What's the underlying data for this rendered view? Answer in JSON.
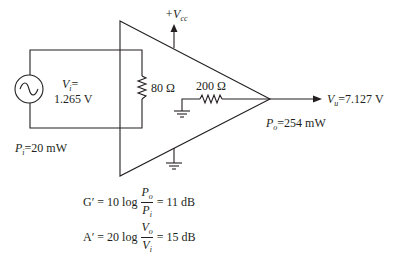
{
  "circuit": {
    "supply_label": "+V",
    "supply_sub": "cc",
    "input_voltage": {
      "symbol": "V",
      "sub": "i",
      "eq": "=",
      "value": "1.265 V"
    },
    "input_resistor": "80 Ω",
    "output_resistor": "200 Ω",
    "output_voltage": {
      "symbol": "V",
      "sub": "u",
      "value": "=7.127 V"
    },
    "output_power": {
      "symbol": "P",
      "sub": "o",
      "value": "=254 mW"
    },
    "input_power": {
      "symbol": "P",
      "sub": "i",
      "value": "=20 mW"
    }
  },
  "equations": {
    "power_gain": {
      "lhs": "G′ = 10 log",
      "num": "P",
      "num_sub": "o",
      "den": "P",
      "den_sub": "i",
      "rhs": "= 11 dB"
    },
    "voltage_gain": {
      "lhs": "A′ = 20 log",
      "num": "V",
      "num_sub": "o",
      "den": "V",
      "den_sub": "i",
      "rhs": "= 15 dB"
    }
  },
  "colors": {
    "ink": "#231f20"
  }
}
